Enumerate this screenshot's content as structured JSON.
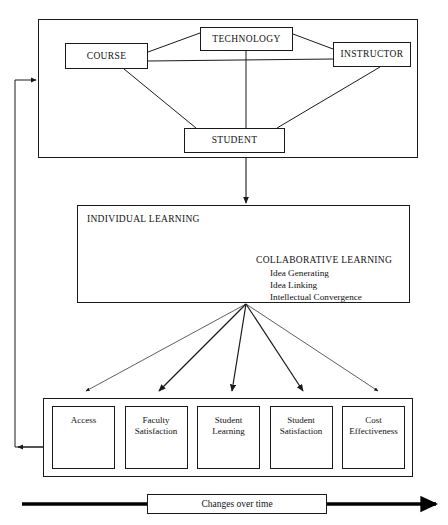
{
  "diagram": {
    "line_color": "#1a1a1a",
    "background": "#ffffff"
  },
  "top_cluster": {
    "name": "interaction-frame",
    "nodes": [
      {
        "id": "course",
        "label": "COURSE"
      },
      {
        "id": "technology",
        "label": "TECHNOLOGY"
      },
      {
        "id": "instructor",
        "label": "INSTRUCTOR"
      },
      {
        "id": "student",
        "label": "STUDENT"
      }
    ]
  },
  "learning_band": {
    "individual_label": "INDIVIDUAL LEARNING",
    "collaborative_label": "COLLABORATIVE LEARNING",
    "collaborative_items": [
      "Idea Generating",
      "Idea Linking",
      "Intellectual Convergence"
    ]
  },
  "outcomes": {
    "items": [
      {
        "id": "access",
        "line1": "Access",
        "line2": ""
      },
      {
        "id": "faculty-satisfaction",
        "line1": "Faculty",
        "line2": "Satisfaction"
      },
      {
        "id": "student-learning",
        "line1": "Student",
        "line2": "Learning"
      },
      {
        "id": "student-satisfaction",
        "line1": "Student",
        "line2": "Satisfaction"
      },
      {
        "id": "cost-effectiveness",
        "line1": "Cost",
        "line2": "Effectiveness"
      }
    ]
  },
  "timeline": {
    "label": "Changes over time"
  }
}
